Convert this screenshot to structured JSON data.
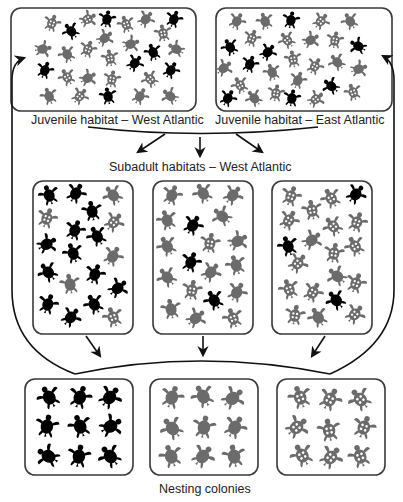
{
  "diagram": {
    "labels": {
      "juvenile_west": "Juvenile habitat – West Atlantic",
      "juvenile_east": "Juvenile habitat – East Atlantic",
      "subadult": "Subadult habitats – West Atlantic",
      "nesting": "Nesting colonies"
    },
    "colors": {
      "black_population": "#000000",
      "gray_population": "#6b6b6b",
      "patterned_population": "#6b6b6b",
      "line": "#111111",
      "box_border": "#3a3a3a"
    },
    "legend_semantics": {
      "black": "solid black turtle = nesting colony A",
      "gray": "solid gray turtle = nesting colony B",
      "patterned": "gray turtle with white spots = nesting colony C"
    },
    "boxes": {
      "juvenile_west": {
        "x": 11,
        "y": 8,
        "w": 185,
        "h": 103,
        "composition": {
          "black": 8,
          "gray": 12,
          "patterned": 11
        }
      },
      "juvenile_east": {
        "x": 216,
        "y": 8,
        "w": 176,
        "h": 103,
        "composition": {
          "black": 8,
          "gray": 11,
          "patterned": 10
        }
      },
      "subadult_1": {
        "x": 33,
        "y": 181,
        "w": 100,
        "h": 153,
        "composition": {
          "black": 13,
          "gray": 5,
          "patterned": 3
        }
      },
      "subadult_2": {
        "x": 153,
        "y": 181,
        "w": 100,
        "h": 153,
        "composition": {
          "black": 3,
          "gray": 15,
          "patterned": 3
        }
      },
      "subadult_3": {
        "x": 272,
        "y": 181,
        "w": 100,
        "h": 153,
        "composition": {
          "black": 3,
          "gray": 3,
          "patterned": 15
        }
      },
      "nesting_black": {
        "x": 25,
        "y": 379,
        "w": 108,
        "h": 96,
        "composition": {
          "black": 9
        }
      },
      "nesting_gray": {
        "x": 150,
        "y": 379,
        "w": 108,
        "h": 96,
        "composition": {
          "gray": 9
        }
      },
      "nesting_patterned": {
        "x": 277,
        "y": 379,
        "w": 108,
        "h": 96,
        "composition": {
          "patterned": 9
        }
      }
    },
    "flows": [
      {
        "from": "juvenile_west",
        "to": "subadult habitats"
      },
      {
        "from": "juvenile_east",
        "to": "subadult habitats"
      },
      {
        "from": "subadult habitats",
        "to": "nesting colonies"
      },
      {
        "from": "nesting colonies",
        "to": "juvenile_west"
      },
      {
        "from": "nesting colonies",
        "to": "juvenile_east"
      }
    ]
  }
}
